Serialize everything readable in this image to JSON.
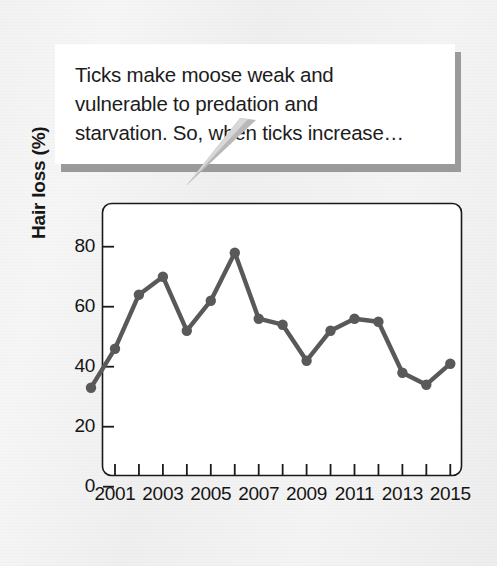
{
  "callout": {
    "text": "Ticks make moose weak and\nvulnerable to predation and\nstarvation. So, when ticks increase…",
    "background": "#ffffff",
    "shadow_color": "#9a9a9a"
  },
  "chart_data": {
    "type": "line",
    "title": "",
    "xlabel": "",
    "ylabel": "Hair loss (%)",
    "ylim": [
      0,
      90
    ],
    "xlim": [
      2000,
      2015
    ],
    "grid": false,
    "legend": "none",
    "marker": "circle",
    "line_color": "#595959",
    "marker_color": "#595959",
    "plot_background": "#ffffff",
    "frame_color": "#1a1a1a",
    "x": [
      2000,
      2001,
      2002,
      2003,
      2004,
      2005,
      2006,
      2007,
      2008,
      2009,
      2010,
      2011,
      2012,
      2013,
      2014,
      2015
    ],
    "values": [
      33,
      46,
      64,
      70,
      52,
      62,
      78,
      56,
      54,
      42,
      52,
      56,
      55,
      38,
      34,
      41
    ],
    "y_ticks": [
      0,
      20,
      40,
      60,
      80
    ],
    "y_tick_labels": [
      "0",
      "20",
      "40",
      "60",
      "80"
    ],
    "x_ticks": [
      2001,
      2002,
      2003,
      2004,
      2005,
      2006,
      2007,
      2008,
      2009,
      2010,
      2011,
      2012,
      2013,
      2014,
      2015
    ],
    "x_tick_labels": [
      "2001",
      "",
      "2003",
      "",
      "2005",
      "",
      "2007",
      "",
      "2009",
      "",
      "2011",
      "",
      "2013",
      "",
      "2015"
    ],
    "x_labeled": [
      "2001",
      "2003",
      "2005",
      "2007",
      "2009",
      "2011",
      "2013",
      "2015"
    ]
  }
}
